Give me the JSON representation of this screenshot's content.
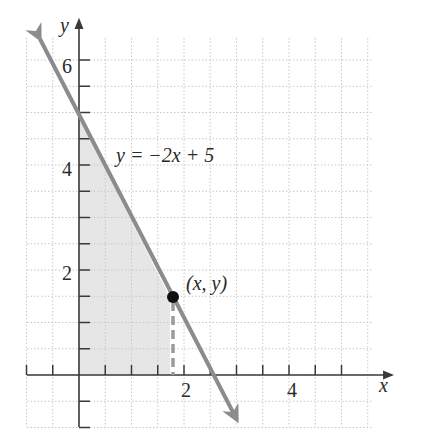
{
  "chart_data": {
    "type": "line",
    "title": "",
    "xlabel": "x",
    "ylabel": "y",
    "xlim": [
      -1,
      5.5
    ],
    "ylim": [
      -1,
      6.5
    ],
    "grid": true,
    "grid_step": 0.5,
    "x_ticks": [
      2,
      4
    ],
    "x_tick_labels": [
      "2",
      "4"
    ],
    "y_ticks": [
      2,
      4,
      6
    ],
    "y_tick_labels": [
      "2",
      "4",
      "6"
    ],
    "series": [
      {
        "name": "y = −2x + 5",
        "equation": "y = -2x + 5",
        "slope": -2,
        "intercept": 5,
        "x": [
          -0.75,
          3.05
        ],
        "y": [
          6.5,
          -0.9
        ]
      }
    ],
    "shaded_region": {
      "description": "region under the line in the first quadrant, from x = 0 to the point's x",
      "vertices": [
        [
          0,
          0
        ],
        [
          0,
          5
        ],
        [
          1.75,
          1.5
        ],
        [
          1.75,
          0
        ]
      ]
    },
    "point": {
      "x": 1.75,
      "y": 1.5,
      "label": "(x, y)"
    },
    "annotations": [
      {
        "text": "y = −2x + 5",
        "x": 0.7,
        "y": 4.3
      },
      {
        "text": "(x, y)",
        "x": 2.2,
        "y": 1.75
      }
    ]
  },
  "labels": {
    "x_axis": "x",
    "y_axis": "y",
    "equation": "y = −2x + 5",
    "point": "(x, y)",
    "tick_x_2": "2",
    "tick_x_4": "4",
    "tick_y_2": "2",
    "tick_y_4": "4",
    "tick_y_6": "6"
  },
  "colors": {
    "line": "#8c8c8c",
    "axis": "#3a3a3a",
    "grid": "#c8c8c8",
    "shade": "#e6e6e6",
    "point": "#111111",
    "dashed": "#9a9a9a"
  }
}
